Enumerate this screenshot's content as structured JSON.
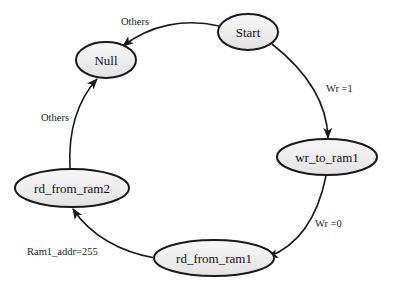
{
  "diagram": {
    "type": "state-machine",
    "colors": {
      "node_fill_top": "#f8f8f8",
      "node_fill_bottom": "#e4e4e4",
      "stroke": "#1a1a1a",
      "text": "#111111"
    },
    "nodes": [
      {
        "id": "null",
        "label": "Null"
      },
      {
        "id": "start",
        "label": "Start"
      },
      {
        "id": "wr_to_ram1",
        "label": "wr_to_ram1"
      },
      {
        "id": "rd_from_ram1",
        "label": "rd_from_ram1"
      },
      {
        "id": "rd_from_ram2",
        "label": "rd_from_ram2"
      }
    ],
    "edges": [
      {
        "from": "start",
        "to": "null",
        "label": "Others"
      },
      {
        "from": "start",
        "to": "wr_to_ram1",
        "label": "Wr =1"
      },
      {
        "from": "wr_to_ram1",
        "to": "rd_from_ram1",
        "label": "Wr =0"
      },
      {
        "from": "rd_from_ram1",
        "to": "rd_from_ram2",
        "label": "Ram1_addr=255"
      },
      {
        "from": "rd_from_ram2",
        "to": "null",
        "label": "Others"
      }
    ]
  }
}
